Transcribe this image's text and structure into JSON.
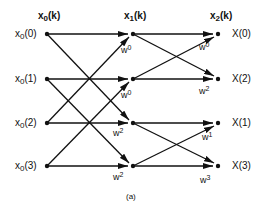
{
  "diagram": {
    "type": "fft-butterfly",
    "caption": "(a)",
    "columns": [
      {
        "header_base": "x",
        "header_sub": "0",
        "header_arg": "(k)"
      },
      {
        "header_base": "x",
        "header_sub": "1",
        "header_arg": "(k)"
      },
      {
        "header_base": "x",
        "header_sub": "2",
        "header_arg": "(k)"
      }
    ],
    "inputs": [
      {
        "base": "x",
        "sub": "0",
        "arg": "(0)"
      },
      {
        "base": "x",
        "sub": "0",
        "arg": "(1)"
      },
      {
        "base": "x",
        "sub": "0",
        "arg": "(2)"
      },
      {
        "base": "x",
        "sub": "0",
        "arg": "(3)"
      }
    ],
    "outputs": [
      "X(0)",
      "X(2)",
      "X(1)",
      "X(3)"
    ],
    "stage1_weights": [
      {
        "base": "w",
        "exp": "0"
      },
      {
        "base": "w",
        "exp": "0"
      },
      {
        "base": "w",
        "exp": "2"
      },
      {
        "base": "w",
        "exp": "2"
      }
    ],
    "stage2_weights": [
      {
        "base": "w",
        "exp": "0"
      },
      {
        "base": "w",
        "exp": "2"
      },
      {
        "base": "w",
        "exp": "1"
      },
      {
        "base": "w",
        "exp": "3"
      }
    ]
  }
}
